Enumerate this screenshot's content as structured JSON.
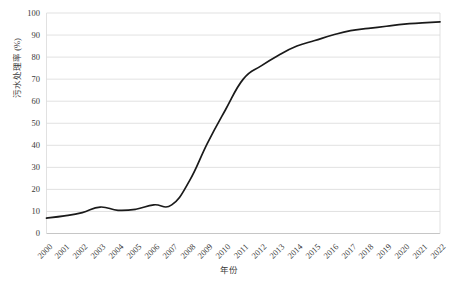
{
  "chart_data": {
    "type": "line",
    "title": "",
    "subtitle": "",
    "xlabel": "年份",
    "ylabel": "污水处理率 (%)",
    "xlim": [
      2000,
      2022
    ],
    "ylim": [
      0,
      100
    ],
    "ytick_interval": 10,
    "grid": "horizontal",
    "legend": "none",
    "line_color": "#1a1a1a",
    "grid_color": "#d9d9d9",
    "background_color": "#ffffff",
    "categories": [
      "2000",
      "2001",
      "2002",
      "2003",
      "2004",
      "2005",
      "2006",
      "2007",
      "2008",
      "2009",
      "2010",
      "2011",
      "2012",
      "2013",
      "2014",
      "2015",
      "2016",
      "2017",
      "2018",
      "2019",
      "2020",
      "2021",
      "2022"
    ],
    "ytick_labels": [
      "0",
      "10",
      "20",
      "30",
      "40",
      "50",
      "60",
      "70",
      "80",
      "90",
      "100"
    ],
    "ytick_values": [
      0,
      10,
      20,
      30,
      40,
      50,
      60,
      70,
      80,
      90,
      100
    ],
    "series": [
      {
        "name": "污水处理率",
        "values": [
          7,
          8,
          9.5,
          12,
          10.5,
          11,
          13,
          13,
          24,
          41,
          56,
          70,
          76,
          81,
          85,
          87.5,
          90,
          92,
          93,
          94,
          95,
          95.5,
          96
        ]
      }
    ],
    "annotations": []
  }
}
